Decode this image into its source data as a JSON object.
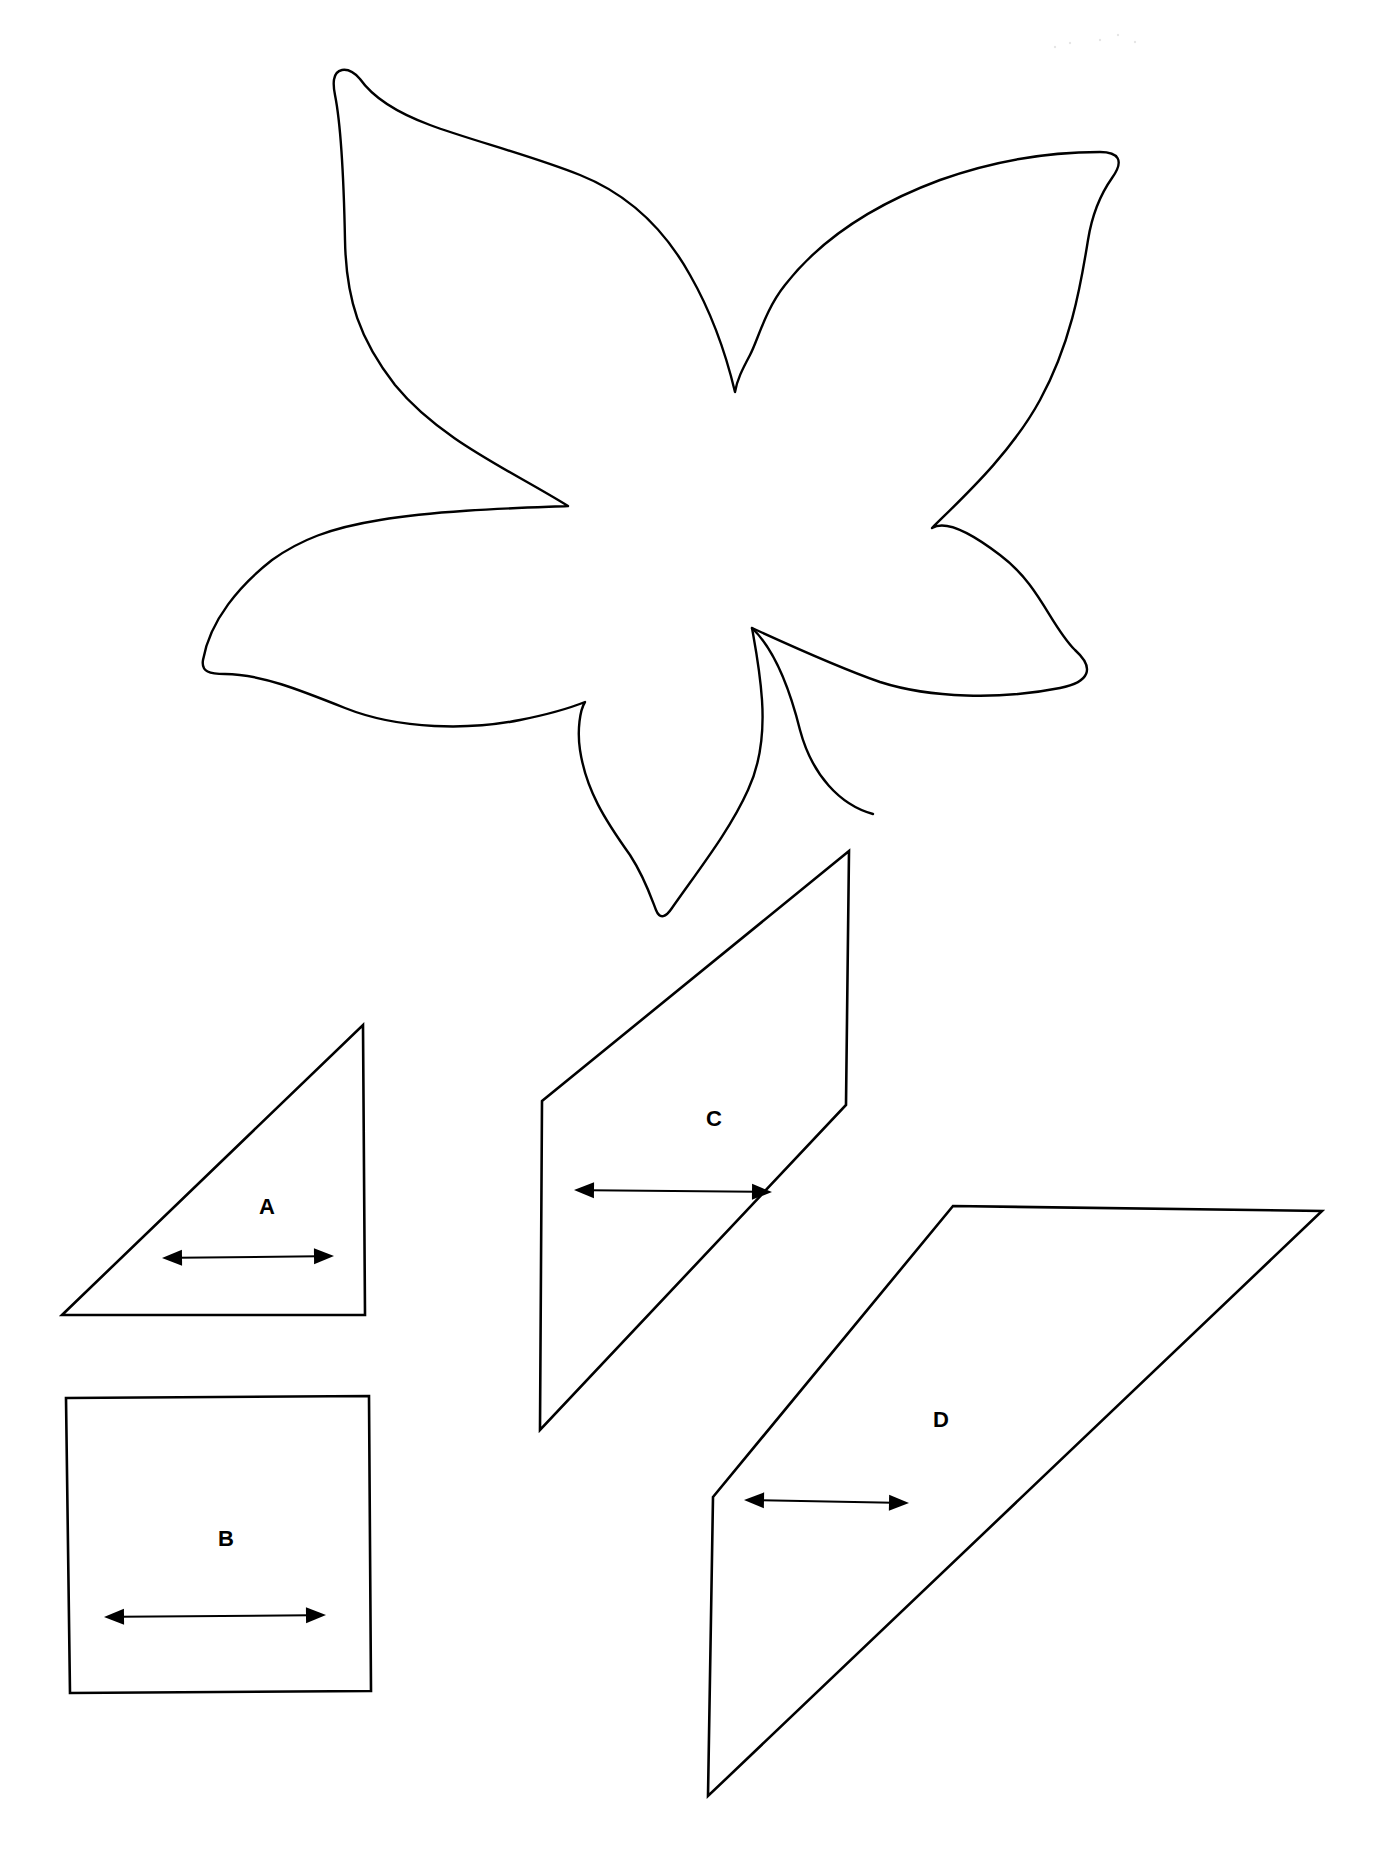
{
  "page": {
    "background": "#ffffff",
    "line_color": "#000000"
  },
  "flower": {
    "name": "Flower appliqué template",
    "petals": 5,
    "outline_path": "M 342 70 C 332 72 333 85 335 95 C 342 130 344 190 345 240 C 346 300 360 340 395 385 C 440 440 510 470 568 506 C 520 508 440 510 380 520 C 330 528 300 540 272 560 C 240 585 210 620 203 660 C 201 672 210 674 225 674 C 260 674 300 690 345 708 C 400 730 470 730 520 720 C 550 714 570 708 585 702 C 580 710 577 730 580 750 C 586 790 605 820 630 855 C 645 878 652 900 656 910 C 660 920 666 917 672 908 C 700 868 730 830 748 790 C 762 760 764 730 762 700 C 760 670 755 645 752 628 C 800 650 840 668 880 682 C 930 698 1000 700 1060 688 C 1090 682 1095 668 1075 650 C 1050 625 1040 585 1000 555 C 970 532 945 520 932 528 C 960 500 1010 455 1040 400 C 1070 345 1080 290 1088 240 C 1092 215 1100 195 1112 178 C 1125 160 1118 152 1100 152 C 1040 152 990 162 940 180 C 870 206 820 240 785 285 C 765 310 758 340 750 355 C 742 370 737 380 735 392 C 725 350 710 310 690 275 C 665 230 630 195 580 175 C 530 155 470 140 430 125 C 395 112 372 96 360 79 C 354 72 348 69 342 70 Z",
    "inner_line_path": "M 752 628 C 775 650 790 690 800 730 C 812 775 840 805 873 814",
    "ghost_mark": {
      "x": 1040,
      "y": 55,
      "text": ""
    }
  },
  "templates": [
    {
      "id": "A",
      "label": "A",
      "shape": "right triangle",
      "points": "62,1315 363,1025 365,1315",
      "label_pos": {
        "x": 267,
        "y": 1208
      },
      "grainline": {
        "x1": 162,
        "y1": 1258,
        "x2": 334,
        "y2": 1256
      }
    },
    {
      "id": "B",
      "label": "B",
      "shape": "square",
      "points": "66,1398 369,1396 371,1691 70,1693",
      "label_pos": {
        "x": 226,
        "y": 1540
      },
      "grainline": {
        "x1": 104,
        "y1": 1617,
        "x2": 326,
        "y2": 1615
      }
    },
    {
      "id": "C",
      "label": "C",
      "shape": "parallelogram",
      "points": "542,1101 849,851 846,1105 540,1430",
      "label_pos": {
        "x": 714,
        "y": 1120
      },
      "grainline": {
        "x1": 574,
        "y1": 1190,
        "x2": 772,
        "y2": 1192
      }
    },
    {
      "id": "D",
      "label": "D",
      "shape": "parallelogram",
      "points": "713,1497 953,1206 1322,1211 708,1796",
      "label_pos": {
        "x": 941,
        "y": 1421
      },
      "grainline": {
        "x1": 744,
        "y1": 1500,
        "x2": 909,
        "y2": 1503
      }
    }
  ]
}
